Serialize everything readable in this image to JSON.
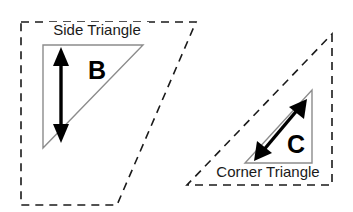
{
  "figure": {
    "background_color": "#ffffff",
    "width": 353,
    "height": 212,
    "colors": {
      "outline_stroke": "#1a1a1a",
      "inner_triangle_stroke": "#8c8c8c",
      "arrow_fill": "#000000",
      "text": "#1a1a1a"
    },
    "shapes": {
      "side_region": {
        "name": "side-region-outline",
        "style": "dashed",
        "kind": "parallelogram",
        "points": "21,22 196,22 117,205 21,205"
      },
      "corner_region": {
        "name": "corner-region-outline",
        "style": "dashed",
        "kind": "triangle",
        "points": "332,34 332,185 187,185"
      },
      "side_inner_triangle": {
        "name": "side-inner-triangle",
        "style": "solid",
        "points": "43,45 143,45 43,148"
      },
      "corner_inner_triangle": {
        "name": "corner-inner-triangle",
        "style": "solid",
        "points": "312,90 312,163 245,163"
      }
    },
    "labels": {
      "side_triangle": "Side Triangle",
      "corner_triangle": "Corner Triangle",
      "side_dimension_letter": "B",
      "corner_dimension_letter": "C"
    },
    "arrows": {
      "side_dimension": {
        "name": "side-dimension-arrow",
        "orientation": "vertical",
        "double_headed": true,
        "x": 61,
        "y_top": 52,
        "y_bottom": 138
      },
      "corner_dimension": {
        "name": "corner-dimension-arrow",
        "orientation": "diagonal",
        "double_headed": true,
        "x_start": 259,
        "y_start": 155,
        "x_end": 302,
        "y_end": 104
      }
    }
  }
}
